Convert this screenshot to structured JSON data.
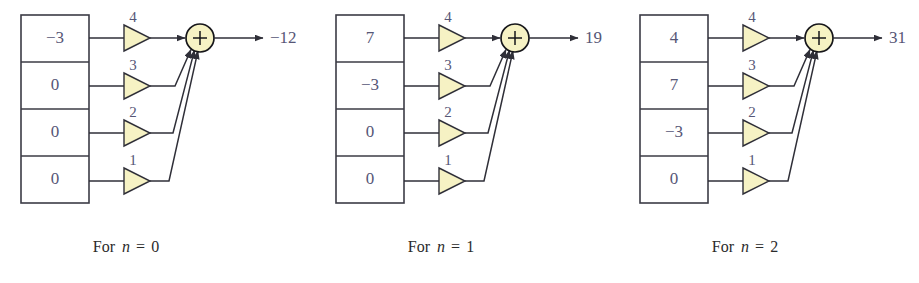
{
  "figure": {
    "background_color": "#ffffff",
    "line_color": "#2f2f38",
    "box_stroke_color": "#3b3b45",
    "accent_fill_color": "#f6f2c4",
    "value_text_color": "#565676",
    "caption_text_color": "#2b2b2b",
    "panel_count": 3
  },
  "chart_data": {
    "type": "diagram",
    "title": "",
    "tap_gains": [
      4,
      3,
      2,
      1
    ],
    "adder_symbol": "+",
    "panels": [
      {
        "caption_prefix": "For",
        "caption_var": "n",
        "caption_eq": "=",
        "caption_value": "0",
        "caption": "For n = 0",
        "register_values": [
          "−3",
          "0",
          "0",
          "0"
        ],
        "register_values_numeric": [
          -3,
          0,
          0,
          0
        ],
        "gains": [
          "4",
          "3",
          "2",
          "1"
        ],
        "output": "−12",
        "output_numeric": -12
      },
      {
        "caption_prefix": "For",
        "caption_var": "n",
        "caption_eq": "=",
        "caption_value": "1",
        "caption": "For n = 1",
        "register_values": [
          "7",
          "−3",
          "0",
          "0"
        ],
        "register_values_numeric": [
          7,
          -3,
          0,
          0
        ],
        "gains": [
          "4",
          "3",
          "2",
          "1"
        ],
        "output": "19",
        "output_numeric": 19
      },
      {
        "caption_prefix": "For",
        "caption_var": "n",
        "caption_eq": "=",
        "caption_value": "2",
        "caption": "For n = 2",
        "register_values": [
          "4",
          "7",
          "−3",
          "0"
        ],
        "register_values_numeric": [
          4,
          7,
          -3,
          0
        ],
        "gains": [
          "4",
          "3",
          "2",
          "1"
        ],
        "output": "31",
        "output_numeric": 31
      }
    ]
  },
  "geometry": {
    "panel_origins": [
      21,
      336,
      640
    ],
    "box_top": 15,
    "box_width": 68,
    "cell_height": 47,
    "cell_count": 4,
    "tap_y": [
      38,
      86,
      133,
      181
    ],
    "amp_x": 103,
    "amp_width": 26,
    "amp_height": 26,
    "sum_cx": 179,
    "sum_cy": 38,
    "sum_r": 14,
    "out_arrow_end": 242,
    "out_label_x": 249,
    "caption_y": 252,
    "caption_cx": 105
  }
}
